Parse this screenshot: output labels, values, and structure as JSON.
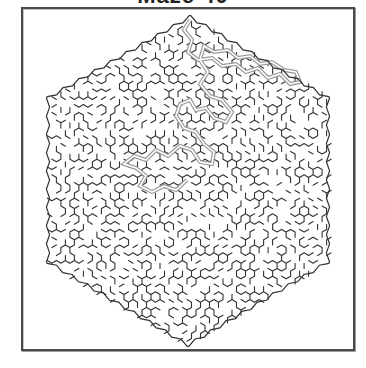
{
  "title": "Maze 40",
  "maze": {
    "shape": "hexagon",
    "cell_type": "hexagonal",
    "outline_vertices": [
      [
        190,
        17
      ],
      [
        328,
        98
      ],
      [
        328,
        262
      ],
      [
        188,
        345
      ],
      [
        48,
        262
      ],
      [
        48,
        98
      ]
    ],
    "center_goal": [
      187,
      180
    ],
    "wall_color": "#333333",
    "solution_color": "#9a9a9a",
    "background": "#ffffff",
    "solution_path": [
      [
        190,
        20
      ],
      [
        184,
        30
      ],
      [
        192,
        40
      ],
      [
        188,
        52
      ],
      [
        198,
        60
      ],
      [
        212,
        58
      ],
      [
        222,
        66
      ],
      [
        236,
        64
      ],
      [
        246,
        72
      ],
      [
        258,
        68
      ],
      [
        268,
        78
      ],
      [
        280,
        74
      ],
      [
        290,
        84
      ],
      [
        300,
        82
      ],
      [
        296,
        72
      ],
      [
        284,
        70
      ],
      [
        272,
        62
      ],
      [
        260,
        64
      ],
      [
        250,
        56
      ],
      [
        238,
        58
      ],
      [
        228,
        50
      ],
      [
        214,
        52
      ],
      [
        204,
        46
      ],
      [
        200,
        60
      ],
      [
        208,
        72
      ],
      [
        200,
        84
      ],
      [
        210,
        96
      ],
      [
        222,
        100
      ],
      [
        232,
        112
      ],
      [
        226,
        122
      ],
      [
        214,
        118
      ],
      [
        206,
        108
      ],
      [
        196,
        110
      ],
      [
        190,
        100
      ],
      [
        180,
        104
      ],
      [
        176,
        116
      ],
      [
        184,
        128
      ],
      [
        196,
        132
      ],
      [
        204,
        144
      ],
      [
        214,
        152
      ],
      [
        212,
        164
      ],
      [
        200,
        162
      ],
      [
        192,
        150
      ],
      [
        180,
        146
      ],
      [
        168,
        156
      ],
      [
        156,
        150
      ],
      [
        146,
        160
      ],
      [
        134,
        156
      ],
      [
        124,
        164
      ],
      [
        136,
        168
      ],
      [
        146,
        176
      ],
      [
        140,
        186
      ],
      [
        152,
        192
      ],
      [
        164,
        186
      ],
      [
        176,
        190
      ],
      [
        187,
        180
      ]
    ]
  },
  "colors": {
    "frame": "#4a4a4a",
    "frame_shadow": "#9a9a9a"
  }
}
